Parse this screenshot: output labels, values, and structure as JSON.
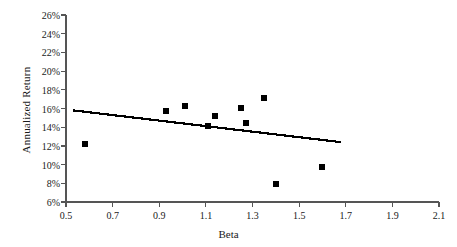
{
  "chart_data": {
    "type": "scatter",
    "title": "",
    "xlabel": "Beta",
    "ylabel": "Annualized Return",
    "xlim": [
      0.5,
      2.1
    ],
    "ylim": [
      6,
      26
    ],
    "xticks": [
      "0.5",
      "0.7",
      "0.9",
      "1.1",
      "1.3",
      "1.5",
      "1.7",
      "1.9",
      "2.1"
    ],
    "xtick_values": [
      0.5,
      0.7,
      0.9,
      1.1,
      1.3,
      1.5,
      1.7,
      1.9,
      2.1
    ],
    "yticks": [
      "6%",
      "8%",
      "10%",
      "12%",
      "14%",
      "16%",
      "18%",
      "20%",
      "22%",
      "24%",
      "26%"
    ],
    "ytick_values": [
      6,
      8,
      10,
      12,
      14,
      16,
      18,
      20,
      22,
      24,
      26
    ],
    "grid": false,
    "legend": "none",
    "marker_style": "filled-square",
    "marker_color": "#000000",
    "series": [
      {
        "name": "Observations",
        "points": [
          {
            "x": 0.58,
            "y": 12.2
          },
          {
            "x": 0.93,
            "y": 15.7
          },
          {
            "x": 1.01,
            "y": 16.3
          },
          {
            "x": 1.11,
            "y": 14.1
          },
          {
            "x": 1.14,
            "y": 15.2
          },
          {
            "x": 1.25,
            "y": 16.1
          },
          {
            "x": 1.27,
            "y": 14.4
          },
          {
            "x": 1.35,
            "y": 17.1
          },
          {
            "x": 1.4,
            "y": 7.9
          },
          {
            "x": 1.6,
            "y": 9.7
          }
        ]
      }
    ],
    "trendline": {
      "name": "Fitted regression line",
      "color": "#000000",
      "x_start": 0.53,
      "y_start": 15.8,
      "x_end": 1.68,
      "y_end": 12.4
    },
    "axis_color": "#555555"
  }
}
